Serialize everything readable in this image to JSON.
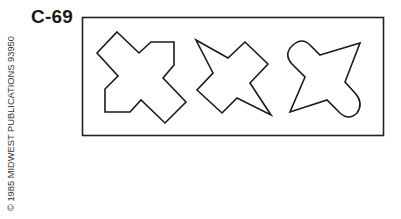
{
  "card": {
    "id": "C-69",
    "copyright": "© 1985 MIDWEST PUBLICATIONS 93950"
  },
  "frame": {
    "x": 82,
    "y": 17,
    "width": 301,
    "height": 119,
    "stroke": "#222222"
  },
  "shapes": [
    {
      "name": "shape-1-cross",
      "description": "X-shaped cross with squared corners"
    },
    {
      "name": "shape-2-star",
      "description": "Four-pointed star with pointed tips"
    },
    {
      "name": "shape-3-rounded",
      "description": "Four-pointed figure with two rounded lobes"
    }
  ]
}
